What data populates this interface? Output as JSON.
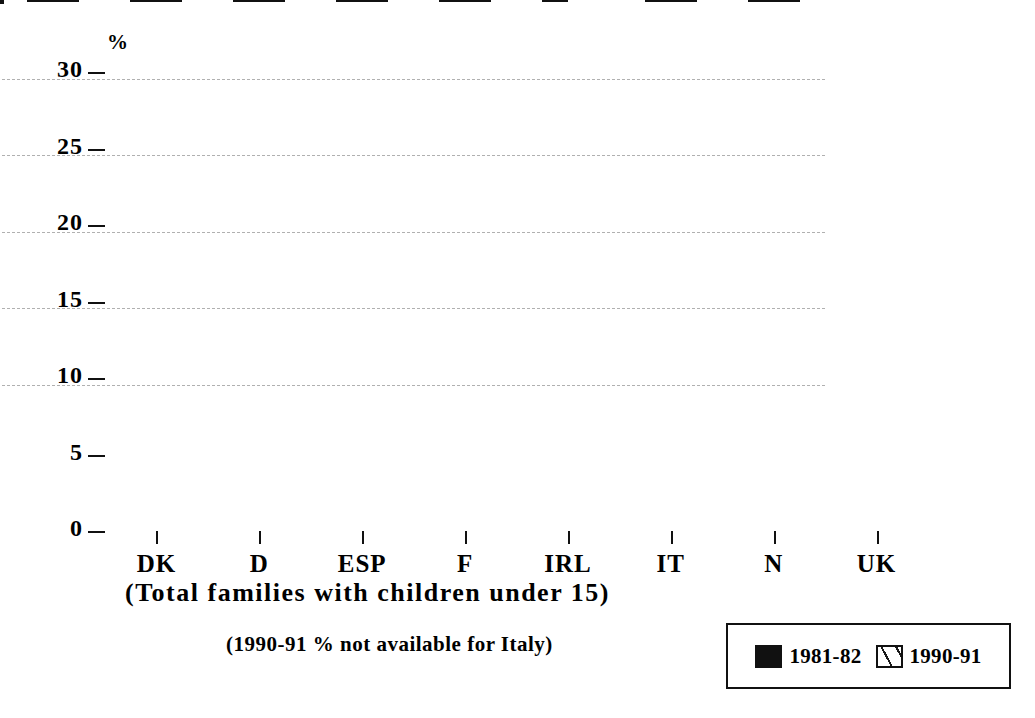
{
  "chart_data": {
    "type": "bar",
    "title": "",
    "xlabel": "(Total families with children under 15)",
    "ylabel": "%",
    "ylim": [
      0,
      30
    ],
    "yticks": [
      0,
      5,
      10,
      15,
      20,
      25,
      30
    ],
    "grid": true,
    "legend_position": "bottom-right",
    "categories": [
      "DK",
      "D",
      "ESP",
      "F",
      "IRL",
      "IT",
      "N",
      "UK"
    ],
    "series": [
      {
        "name": "1981-82",
        "style": "solid-black",
        "values": [
          18.2,
          9.9,
          5.4,
          8.5,
          7.3,
          7.4,
          8.0,
          13.8
        ]
      },
      {
        "name": "1990-91",
        "style": "hatched",
        "values": [
          20.4,
          15.4,
          6.1,
          10.9,
          10.8,
          null,
          12.3,
          19.0
        ]
      }
    ],
    "annotations": [
      "(1990-91 % not available for Italy)"
    ]
  },
  "axis": {
    "y_unit_label": "%",
    "y_tick_labels": [
      "30",
      "25",
      "20",
      "15",
      "10",
      "5",
      "0"
    ]
  },
  "captions": {
    "x_axis_title": "(Total families with children under 15)",
    "footnote": "(1990-91 % not available for Italy)"
  },
  "legend": {
    "entries": [
      {
        "label": "1981-82",
        "style": "solid"
      },
      {
        "label": "1990-91",
        "style": "hatched"
      }
    ]
  }
}
